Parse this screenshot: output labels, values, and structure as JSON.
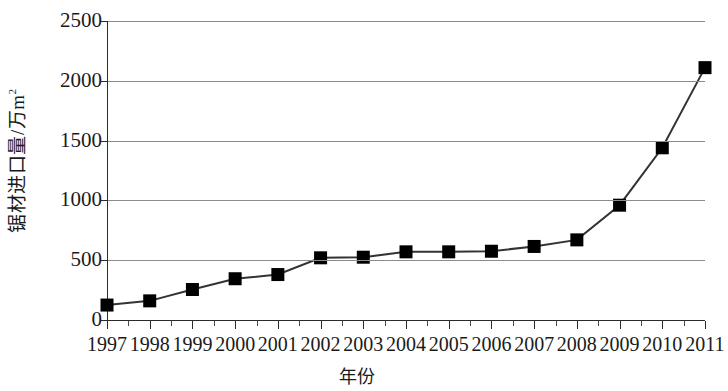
{
  "chart_data": {
    "type": "line",
    "title": "",
    "xlabel": "年份",
    "ylabel": "锯材进口量/万m²",
    "ylabel_text": "锯材进口量/万m",
    "ylabel_superscript": "2",
    "categories": [
      "1997",
      "1998",
      "1999",
      "2000",
      "2001",
      "2002",
      "2003",
      "2004",
      "2005",
      "2006",
      "2007",
      "2008",
      "2009",
      "2010",
      "2011"
    ],
    "x": [
      1997,
      1998,
      1999,
      2000,
      2001,
      2002,
      2003,
      2004,
      2005,
      2006,
      2007,
      2008,
      2009,
      2010,
      2011
    ],
    "values": [
      125,
      160,
      255,
      345,
      380,
      520,
      525,
      570,
      570,
      575,
      615,
      670,
      960,
      1440,
      2110
    ],
    "series": [
      {
        "name": "锯材进口量",
        "values": [
          125,
          160,
          255,
          345,
          380,
          520,
          525,
          570,
          570,
          575,
          615,
          670,
          960,
          1440,
          2110
        ]
      }
    ],
    "ylim": [
      0,
      2500
    ],
    "xlim": [
      1997,
      2011
    ],
    "ytick_values": [
      0,
      500,
      1000,
      1500,
      2000,
      2500
    ],
    "ytick_labels": [
      "0",
      "500",
      "1000",
      "1500",
      "2000",
      "2500"
    ],
    "grid": true,
    "grid_axis": "y",
    "legend": false,
    "legend_position": "none",
    "marker": "square",
    "marker_color": "#000000",
    "line_color": "#333333",
    "grid_color": "#8c8c8c",
    "axis_color": "#2b2b2b",
    "minor_xticks": true
  }
}
